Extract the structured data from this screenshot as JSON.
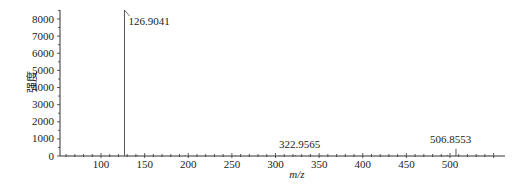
{
  "chart_data": {
    "type": "line",
    "subtype": "mass-spectrum-stick",
    "title": "",
    "xlabel": "m/z",
    "ylabel": "强度",
    "xlim": [
      50,
      555
    ],
    "ylim": [
      0,
      8600
    ],
    "x_ticks": [
      100,
      150,
      200,
      250,
      300,
      350,
      400,
      450,
      500
    ],
    "y_ticks": [
      0,
      1000,
      2000,
      3000,
      4000,
      5000,
      6000,
      7000,
      8000
    ],
    "grid": false,
    "legend": null,
    "peaks": [
      {
        "mz": 126.9041,
        "intensity": 8600,
        "label": "126.9041"
      },
      {
        "mz": 322.9565,
        "intensity": 60,
        "label": "322.9565"
      },
      {
        "mz": 506.8553,
        "intensity": 420,
        "label": "506.8553"
      }
    ],
    "minor_peaks": [
      {
        "mz": 63,
        "intensity": 40
      },
      {
        "mz": 78,
        "intensity": 30
      },
      {
        "mz": 91,
        "intensity": 45
      },
      {
        "mz": 142,
        "intensity": 50
      },
      {
        "mz": 160,
        "intensity": 35
      },
      {
        "mz": 196,
        "intensity": 40
      },
      {
        "mz": 254,
        "intensity": 45
      },
      {
        "mz": 270,
        "intensity": 30
      },
      {
        "mz": 286,
        "intensity": 35
      },
      {
        "mz": 305,
        "intensity": 50
      },
      {
        "mz": 338,
        "intensity": 45
      },
      {
        "mz": 352,
        "intensity": 40
      },
      {
        "mz": 380,
        "intensity": 40
      },
      {
        "mz": 414,
        "intensity": 30
      },
      {
        "mz": 448,
        "intensity": 35
      },
      {
        "mz": 480,
        "intensity": 40
      },
      {
        "mz": 497,
        "intensity": 60
      },
      {
        "mz": 520,
        "intensity": 55
      },
      {
        "mz": 532,
        "intensity": 45
      },
      {
        "mz": 545,
        "intensity": 40
      }
    ]
  },
  "colors": {
    "axis": "#333333",
    "peak": "#555555",
    "text": "#222222"
  }
}
